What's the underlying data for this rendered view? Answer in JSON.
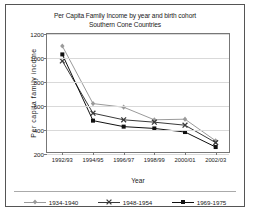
{
  "chart_data": {
    "type": "line",
    "title": "Per Capita Family Income by year and birth cohort",
    "subtitle": "Southern Cone Countries",
    "xlabel": "Year",
    "ylabel": "Per capita family income",
    "categories": [
      "1992/93",
      "1994/95",
      "1996/97",
      "1998/99",
      "2000/01",
      "2002/03"
    ],
    "ylim": [
      200,
      1200
    ],
    "yticks": [
      200,
      400,
      600,
      800,
      1000,
      1200
    ],
    "grid": true,
    "legend_position": "bottom",
    "series": [
      {
        "name": "1934-1940",
        "marker": "diamond",
        "color": "#9a9a9a",
        "values": [
          1100,
          620,
          590,
          485,
          490,
          310
        ]
      },
      {
        "name": "1948-1954",
        "marker": "x",
        "color": "#3a3a3a",
        "values": [
          975,
          540,
          485,
          465,
          440,
          295
        ]
      },
      {
        "name": "1969-1975",
        "marker": "square",
        "color": "#111111",
        "values": [
          1030,
          478,
          428,
          413,
          383,
          258
        ]
      }
    ]
  }
}
